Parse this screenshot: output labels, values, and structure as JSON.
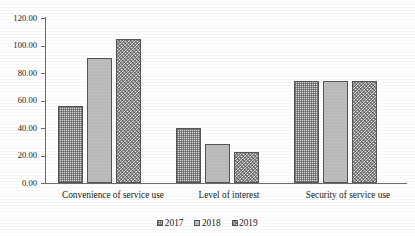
{
  "chart_data": {
    "type": "bar",
    "title": "",
    "subtitle": "",
    "xlabel": "",
    "ylabel": "",
    "categories": [
      "Convenience of service use",
      "Level of interest",
      "Security of service use"
    ],
    "series": [
      {
        "name": "2017",
        "values": [
          56.0,
          40.0,
          74.0
        ],
        "pattern": "fine-crosshatch",
        "color": "#d8d8d8"
      },
      {
        "name": "2018",
        "values": [
          91.0,
          28.5,
          74.0
        ],
        "pattern": "solid-gray",
        "color": "#b9b9b9"
      },
      {
        "name": "2019",
        "values": [
          105.0,
          22.5,
          74.0
        ],
        "pattern": "coarse-speckle",
        "color": "#cdcdcd"
      }
    ],
    "ylim": [
      0,
      120
    ],
    "ytick_step": 20,
    "ytick_labels": [
      "120.00",
      "100.00",
      "80.00",
      "60.00",
      "40.00",
      "20.00",
      "0.00"
    ],
    "ytick_values": [
      120,
      100,
      80,
      60,
      40,
      20,
      0
    ],
    "grid": false,
    "legend_position": "bottom-center",
    "axis_color": "#6b6b6b",
    "bar_border_color": "#555555"
  },
  "legend": {
    "items": [
      {
        "label": "2017",
        "swatch_name": "legend-swatch-2017"
      },
      {
        "label": "2018",
        "swatch_name": "legend-swatch-2018"
      },
      {
        "label": "2019",
        "swatch_name": "legend-swatch-2019"
      }
    ]
  }
}
